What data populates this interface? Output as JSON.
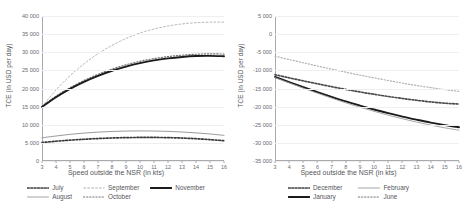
{
  "chart_data": [
    {
      "type": "line",
      "panel": "left",
      "title": "",
      "xlabel": "Speed outside the NSR (in kts)",
      "ylabel": "TCE (in USD per day)",
      "xlim": [
        3,
        16
      ],
      "ylim": [
        0,
        40000
      ],
      "grid": true,
      "legend_position": "bottom",
      "xticks": [
        "3",
        "4",
        "5",
        "6",
        "7",
        "8",
        "9",
        "10",
        "11",
        "12",
        "13",
        "14",
        "15",
        "16"
      ],
      "yticks": [
        "0",
        "5 000",
        "10 000",
        "15 000",
        "20 000",
        "25 000",
        "30 000",
        "35 000",
        "40 000"
      ],
      "x": [
        3,
        4,
        5,
        6,
        7,
        8,
        9,
        10,
        11,
        12,
        13,
        14,
        15,
        16
      ],
      "series": [
        {
          "name": "July",
          "style": "dotted-bold",
          "color": "#3a3a3c",
          "values": [
            5100,
            5450,
            5750,
            6000,
            6200,
            6350,
            6450,
            6500,
            6500,
            6450,
            6330,
            6150,
            5900,
            5600
          ]
        },
        {
          "name": "August",
          "style": "solid-thin",
          "color": "#8d8e92",
          "values": [
            6400,
            6900,
            7350,
            7700,
            7970,
            8150,
            8260,
            8300,
            8270,
            8170,
            8000,
            7760,
            7450,
            7070
          ]
        },
        {
          "name": "September",
          "style": "dashed-dotted",
          "color": "#b9babd",
          "values": [
            15000,
            19600,
            23500,
            26800,
            29600,
            31900,
            33800,
            35300,
            36400,
            37250,
            37800,
            38150,
            38300,
            38300
          ]
        },
        {
          "name": "October",
          "style": "dotted-fine",
          "color": "#6e6f73",
          "values": [
            15100,
            17900,
            20200,
            22200,
            23900,
            25350,
            26550,
            27500,
            28250,
            28800,
            29200,
            29450,
            29550,
            29500
          ]
        },
        {
          "name": "November",
          "style": "solid-bold",
          "color": "#1b1b1d",
          "values": [
            14900,
            17600,
            19900,
            21850,
            23500,
            24900,
            26050,
            27000,
            27750,
            28300,
            28700,
            28950,
            29000,
            28900
          ]
        }
      ]
    },
    {
      "type": "line",
      "panel": "right",
      "title": "",
      "xlabel": "Speed outside the NSR (in kts)",
      "ylabel": "TCE (in USD per day)",
      "xlim": [
        3,
        16
      ],
      "ylim": [
        -35000,
        5000
      ],
      "grid": true,
      "legend_position": "bottom",
      "xticks": [
        "3",
        "4",
        "5",
        "6",
        "7",
        "8",
        "9",
        "10",
        "11",
        "12",
        "13",
        "14",
        "15",
        "16"
      ],
      "yticks": [
        "-35 000",
        "-30 000",
        "-25 000",
        "-20 000",
        "-15 000",
        "-10 000",
        "-5 000",
        "0",
        "5 000"
      ],
      "x": [
        3,
        4,
        5,
        6,
        7,
        8,
        9,
        10,
        11,
        12,
        13,
        14,
        15,
        16
      ],
      "series": [
        {
          "name": "December",
          "style": "dotted-bold",
          "color": "#4a4b4e",
          "values": [
            -11200,
            -12050,
            -12900,
            -13700,
            -14500,
            -15250,
            -15950,
            -16600,
            -17200,
            -17750,
            -18250,
            -18700,
            -19050,
            -19300
          ]
        },
        {
          "name": "January",
          "style": "solid-bold",
          "color": "#1b1b1d",
          "values": [
            -11800,
            -13250,
            -14650,
            -16000,
            -17300,
            -18550,
            -19700,
            -20800,
            -21800,
            -22750,
            -23600,
            -24400,
            -25100,
            -25700
          ]
        },
        {
          "name": "February",
          "style": "solid-thin",
          "color": "#9a9b9f",
          "values": [
            -12000,
            -13450,
            -14900,
            -16300,
            -17650,
            -18950,
            -20150,
            -21300,
            -22350,
            -23350,
            -24250,
            -25100,
            -25850,
            -26500
          ]
        },
        {
          "name": "June",
          "style": "dotted-fine",
          "color": "#b0b1b5",
          "values": [
            -6100,
            -7000,
            -7900,
            -8800,
            -9650,
            -10500,
            -11300,
            -12050,
            -12800,
            -13500,
            -14150,
            -14750,
            -15300,
            -15800
          ]
        }
      ]
    }
  ],
  "left": {
    "ylabel": "TCE (in USD per day)",
    "xlabel": "Speed outside the NSR (in kts)",
    "yticks": [
      "40 000",
      "35 000",
      "30 000",
      "25 000",
      "20 000",
      "15 000",
      "10 000",
      "5 000",
      "0"
    ],
    "xticks": [
      "3",
      "4",
      "5",
      "6",
      "7",
      "8",
      "9",
      "10",
      "11",
      "12",
      "13",
      "14",
      "15",
      "16"
    ],
    "legend": [
      {
        "label": "July",
        "style": "dotted-bold"
      },
      {
        "label": "September",
        "style": "dashed-dotted"
      },
      {
        "label": "November",
        "style": "solid-bold"
      },
      {
        "label": "August",
        "style": "solid-thin"
      },
      {
        "label": "October",
        "style": "dotted-fine"
      }
    ]
  },
  "right": {
    "ylabel": "TCE (in USD per day)",
    "xlabel": "Speed outside the NSR (in kts)",
    "yticks": [
      "5 000",
      "0",
      "-5 000",
      "-10 000",
      "-15 000",
      "-20 000",
      "-25 000",
      "-30 000",
      "-35 000"
    ],
    "xticks": [
      "3",
      "4",
      "5",
      "6",
      "7",
      "8",
      "9",
      "10",
      "11",
      "12",
      "13",
      "14",
      "15",
      "16"
    ],
    "legend": [
      {
        "label": "December",
        "style": "dotted-bold"
      },
      {
        "label": "February",
        "style": "solid-thin"
      },
      {
        "label": "January",
        "style": "solid-bold"
      },
      {
        "label": "June",
        "style": "dotted-fine"
      }
    ]
  }
}
